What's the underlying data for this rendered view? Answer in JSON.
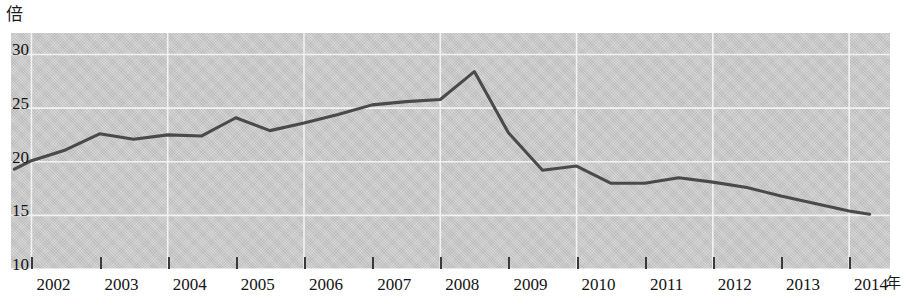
{
  "chart_data": {
    "type": "line",
    "title": "",
    "subtitle": "",
    "xlabel": "年",
    "ylabel": "倍",
    "y_unit_label": "倍",
    "x_unit_label": "年",
    "grid": true,
    "legend": "none",
    "xlim": [
      2001.7,
      2014.6
    ],
    "ylim": [
      10,
      32
    ],
    "yticks": [
      30,
      25,
      20,
      15,
      10
    ],
    "ytick_labels": [
      "30",
      "25",
      "20",
      "15",
      "10"
    ],
    "xticks": [
      2002,
      2003,
      2004,
      2005,
      2006,
      2007,
      2008,
      2009,
      2010,
      2011,
      2012,
      2013,
      2014
    ],
    "xtick_labels": [
      "2002",
      "2003",
      "2004",
      "2005",
      "2006",
      "2007",
      "2008",
      "2009",
      "2010",
      "2011",
      "2012",
      "2013",
      "2014"
    ],
    "series": [
      {
        "name": "倍率",
        "color": "#4a4a4a",
        "x": [
          2001.75,
          2002.0,
          2002.5,
          2003.0,
          2003.5,
          2004.0,
          2004.5,
          2005.0,
          2005.5,
          2006.0,
          2006.5,
          2007.0,
          2007.5,
          2008.0,
          2008.5,
          2009.0,
          2009.5,
          2010.0,
          2010.5,
          2011.0,
          2011.5,
          2012.0,
          2012.5,
          2013.0,
          2013.5,
          2014.0,
          2014.3
        ],
        "values": [
          19.3,
          20.1,
          21.1,
          22.6,
          22.1,
          22.5,
          22.4,
          24.1,
          22.9,
          23.6,
          24.4,
          25.3,
          25.6,
          25.8,
          28.4,
          22.7,
          19.2,
          19.6,
          18.0,
          18.0,
          18.5,
          18.1,
          17.6,
          16.8,
          16.1,
          15.4,
          15.1
        ]
      }
    ],
    "annotations": []
  },
  "colors": {
    "plot_background": "#c9c9c9",
    "grid_line": "#f2f2f2",
    "series_line": "#4a4a4a",
    "tick_mark": "#3a3a3a",
    "text": "#141414",
    "page_background": "#ffffff"
  },
  "geometry": {
    "plot_left": 11,
    "plot_top": 33,
    "plot_width": 879,
    "plot_height": 236
  }
}
